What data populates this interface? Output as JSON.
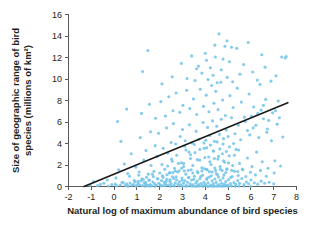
{
  "chart_data": {
    "type": "scatter",
    "title": "",
    "xlabel": "Natural log of maximum abundance of bird species",
    "ylabel": "Size of geographic range of bird species (millions of km²)",
    "ylabel_line1": "Size of geographic range of bird",
    "ylabel_line2": "species (millions of km²)",
    "xlim": [
      -2,
      8
    ],
    "ylim": [
      0,
      16
    ],
    "xticks": [
      -2,
      -1,
      0,
      1,
      2,
      3,
      4,
      5,
      6,
      7,
      8
    ],
    "xticklabels": [
      "-2",
      "-1",
      "0",
      "1",
      "2",
      "3",
      "4",
      "5",
      "6",
      "7",
      "8"
    ],
    "yticks": [
      0,
      2,
      4,
      6,
      8,
      10,
      12,
      14,
      16
    ],
    "yticklabels": [
      "0",
      "2",
      "4",
      "6",
      "8",
      "10",
      "12",
      "14",
      "16"
    ],
    "grid": false,
    "legend": null,
    "point_color": "#74c4e8",
    "trendline_color": "#1a1a1a",
    "axis_color": "#58595b",
    "background_color": "#ffffff",
    "trendline": {
      "type": "linear-fit",
      "x_start": -1.32,
      "y_start": 0.0,
      "x_end": 7.62,
      "y_end": 7.8,
      "slope": 0.872,
      "intercept": 1.151
    },
    "n_points": 508,
    "points": [
      [
        -1.05,
        0.12
      ],
      [
        -0.72,
        0.08
      ],
      [
        -0.45,
        0.3
      ],
      [
        -0.25,
        0.05
      ],
      [
        -0.1,
        0.18
      ],
      [
        0.05,
        0.22
      ],
      [
        0.12,
        0.07
      ],
      [
        0.28,
        0.14
      ],
      [
        0.35,
        0.4
      ],
      [
        0.48,
        0.1
      ],
      [
        0.55,
        0.25
      ],
      [
        0.62,
        0.06
      ],
      [
        0.7,
        0.33
      ],
      [
        0.78,
        0.11
      ],
      [
        0.85,
        0.2
      ],
      [
        0.92,
        0.45
      ],
      [
        1.0,
        0.09
      ],
      [
        1.05,
        0.28
      ],
      [
        1.12,
        0.15
      ],
      [
        1.18,
        0.52
      ],
      [
        1.25,
        0.08
      ],
      [
        1.32,
        0.35
      ],
      [
        1.38,
        0.22
      ],
      [
        1.45,
        0.13
      ],
      [
        1.52,
        0.6
      ],
      [
        1.58,
        0.18
      ],
      [
        1.65,
        0.07
      ],
      [
        1.7,
        0.42
      ],
      [
        1.78,
        0.26
      ],
      [
        1.85,
        0.11
      ],
      [
        1.9,
        0.75
      ],
      [
        1.96,
        0.3
      ],
      [
        2.02,
        0.16
      ],
      [
        2.08,
        0.55
      ],
      [
        2.14,
        0.09
      ],
      [
        2.2,
        0.38
      ],
      [
        2.26,
        0.22
      ],
      [
        2.32,
        0.68
      ],
      [
        2.38,
        0.14
      ],
      [
        2.44,
        0.48
      ],
      [
        2.5,
        0.27
      ],
      [
        2.56,
        0.9
      ],
      [
        2.62,
        0.12
      ],
      [
        2.68,
        0.35
      ],
      [
        2.74,
        0.62
      ],
      [
        2.8,
        0.2
      ],
      [
        2.86,
        0.44
      ],
      [
        2.92,
        0.16
      ],
      [
        2.98,
        0.78
      ],
      [
        3.04,
        0.3
      ],
      [
        3.1,
        0.55
      ],
      [
        3.16,
        0.1
      ],
      [
        3.22,
        0.4
      ],
      [
        3.28,
        0.85
      ],
      [
        3.34,
        0.24
      ],
      [
        3.4,
        0.6
      ],
      [
        3.46,
        0.15
      ],
      [
        3.52,
        0.95
      ],
      [
        3.58,
        0.32
      ],
      [
        3.64,
        0.5
      ],
      [
        3.7,
        0.18
      ],
      [
        3.76,
        0.72
      ],
      [
        3.82,
        0.28
      ],
      [
        3.88,
        1.05
      ],
      [
        3.94,
        0.4
      ],
      [
        4.0,
        0.2
      ],
      [
        4.06,
        0.66
      ],
      [
        4.12,
        0.34
      ],
      [
        4.18,
        0.88
      ],
      [
        4.24,
        0.13
      ],
      [
        4.3,
        0.52
      ],
      [
        4.36,
        0.26
      ],
      [
        4.42,
        0.7
      ],
      [
        4.48,
        0.38
      ],
      [
        4.54,
        1.1
      ],
      [
        4.6,
        0.18
      ],
      [
        4.66,
        0.58
      ],
      [
        4.72,
        0.3
      ],
      [
        4.78,
        0.8
      ],
      [
        4.84,
        0.22
      ],
      [
        4.9,
        0.46
      ],
      [
        4.96,
        0.14
      ],
      [
        5.02,
        0.64
      ],
      [
        5.1,
        0.28
      ],
      [
        5.18,
        0.92
      ],
      [
        5.26,
        0.36
      ],
      [
        5.34,
        0.2
      ],
      [
        5.42,
        0.56
      ],
      [
        5.5,
        0.3
      ],
      [
        5.6,
        0.74
      ],
      [
        5.7,
        0.18
      ],
      [
        5.8,
        0.42
      ],
      [
        5.9,
        0.26
      ],
      [
        6.0,
        0.6
      ],
      [
        6.15,
        0.34
      ],
      [
        6.3,
        0.22
      ],
      [
        6.45,
        0.5
      ],
      [
        6.6,
        0.3
      ],
      [
        6.8,
        0.4
      ],
      [
        7.0,
        0.26
      ],
      [
        0.2,
        1.55
      ],
      [
        0.45,
        2.1
      ],
      [
        0.6,
        1.2
      ],
      [
        0.95,
        1.8
      ],
      [
        1.1,
        1.35
      ],
      [
        1.3,
        2.45
      ],
      [
        1.5,
        1.15
      ],
      [
        1.62,
        1.95
      ],
      [
        1.75,
        1.42
      ],
      [
        1.88,
        2.8
      ],
      [
        2.0,
        1.25
      ],
      [
        2.1,
        2.05
      ],
      [
        2.22,
        1.6
      ],
      [
        2.35,
        3.1
      ],
      [
        2.45,
        1.3
      ],
      [
        2.55,
        2.35
      ],
      [
        2.65,
        1.7
      ],
      [
        2.75,
        2.9
      ],
      [
        2.85,
        1.45
      ],
      [
        2.95,
        2.2
      ],
      [
        3.05,
        1.85
      ],
      [
        3.15,
        3.4
      ],
      [
        3.25,
        1.5
      ],
      [
        3.35,
        2.6
      ],
      [
        3.45,
        1.95
      ],
      [
        3.55,
        3.15
      ],
      [
        3.65,
        1.4
      ],
      [
        3.75,
        2.45
      ],
      [
        3.85,
        1.75
      ],
      [
        3.95,
        3.55
      ],
      [
        4.05,
        1.6
      ],
      [
        4.15,
        2.75
      ],
      [
        4.25,
        2.05
      ],
      [
        4.35,
        3.3
      ],
      [
        4.45,
        1.5
      ],
      [
        4.55,
        2.55
      ],
      [
        4.65,
        1.85
      ],
      [
        4.75,
        3.05
      ],
      [
        4.85,
        2.25
      ],
      [
        4.95,
        1.65
      ],
      [
        5.05,
        2.85
      ],
      [
        5.2,
        1.95
      ],
      [
        5.35,
        3.45
      ],
      [
        5.5,
        2.15
      ],
      [
        5.65,
        1.55
      ],
      [
        5.85,
        2.65
      ],
      [
        6.05,
        1.85
      ],
      [
        6.25,
        3.2
      ],
      [
        6.5,
        2.3
      ],
      [
        6.75,
        1.7
      ],
      [
        7.05,
        2.4
      ],
      [
        7.3,
        1.9
      ],
      [
        0.3,
        4.2
      ],
      [
        0.75,
        3.05
      ],
      [
        1.15,
        4.55
      ],
      [
        1.4,
        3.35
      ],
      [
        1.6,
        5.1
      ],
      [
        1.8,
        3.8
      ],
      [
        1.95,
        4.95
      ],
      [
        2.15,
        3.55
      ],
      [
        2.3,
        5.45
      ],
      [
        2.5,
        4.1
      ],
      [
        2.6,
        5.85
      ],
      [
        2.7,
        3.95
      ],
      [
        2.9,
        4.65
      ],
      [
        3.0,
        5.3
      ],
      [
        3.12,
        4.25
      ],
      [
        3.3,
        5.75
      ],
      [
        3.42,
        4.05
      ],
      [
        3.6,
        5.15
      ],
      [
        3.72,
        4.4
      ],
      [
        3.9,
        5.95
      ],
      [
        4.02,
        4.3
      ],
      [
        4.1,
        5.5
      ],
      [
        4.2,
        4.75
      ],
      [
        4.32,
        6.1
      ],
      [
        4.4,
        4.2
      ],
      [
        4.5,
        5.6
      ],
      [
        4.62,
        4.85
      ],
      [
        4.7,
        6.25
      ],
      [
        4.8,
        4.45
      ],
      [
        4.92,
        5.25
      ],
      [
        5.0,
        4.65
      ],
      [
        5.15,
        6.4
      ],
      [
        5.3,
        4.9
      ],
      [
        5.45,
        5.7
      ],
      [
        5.55,
        4.35
      ],
      [
        5.75,
        6.05
      ],
      [
        5.95,
        4.8
      ],
      [
        6.1,
        5.45
      ],
      [
        6.35,
        4.55
      ],
      [
        6.55,
        6.3
      ],
      [
        6.7,
        5.05
      ],
      [
        6.9,
        4.25
      ],
      [
        7.15,
        5.8
      ],
      [
        7.4,
        4.6
      ],
      [
        0.15,
        6.05
      ],
      [
        0.55,
        7.2
      ],
      [
        1.2,
        6.8
      ],
      [
        1.55,
        7.65
      ],
      [
        1.82,
        6.35
      ],
      [
        2.05,
        7.9
      ],
      [
        2.25,
        6.55
      ],
      [
        2.4,
        8.35
      ],
      [
        2.58,
        7.05
      ],
      [
        2.72,
        8.7
      ],
      [
        2.88,
        6.9
      ],
      [
        3.02,
        7.55
      ],
      [
        3.18,
        8.95
      ],
      [
        3.32,
        7.25
      ],
      [
        3.48,
        8.15
      ],
      [
        3.62,
        6.7
      ],
      [
        3.78,
        9.05
      ],
      [
        3.92,
        7.45
      ],
      [
        4.04,
        8.5
      ],
      [
        4.16,
        6.95
      ],
      [
        4.28,
        9.4
      ],
      [
        4.38,
        7.75
      ],
      [
        4.46,
        8.85
      ],
      [
        4.56,
        7.15
      ],
      [
        4.68,
        9.7
      ],
      [
        4.76,
        8.05
      ],
      [
        4.88,
        6.6
      ],
      [
        5.08,
        8.45
      ],
      [
        5.22,
        7.35
      ],
      [
        5.4,
        9.15
      ],
      [
        5.58,
        7.85
      ],
      [
        5.72,
        6.45
      ],
      [
        5.92,
        8.6
      ],
      [
        6.12,
        7.4
      ],
      [
        6.4,
        9.5
      ],
      [
        6.65,
        8.1
      ],
      [
        6.95,
        6.85
      ],
      [
        7.2,
        7.95
      ],
      [
        1.25,
        10.7
      ],
      [
        1.48,
        12.65
      ],
      [
        2.1,
        9.55
      ],
      [
        2.55,
        10.2
      ],
      [
        2.95,
        11.45
      ],
      [
        3.2,
        10.05
      ],
      [
        3.4,
        12.15
      ],
      [
        3.55,
        9.85
      ],
      [
        3.7,
        11.2
      ],
      [
        3.85,
        10.55
      ],
      [
        4.0,
        12.4
      ],
      [
        4.12,
        9.95
      ],
      [
        4.22,
        11.05
      ],
      [
        4.34,
        10.35
      ],
      [
        4.44,
        12.05
      ],
      [
        4.52,
        9.65
      ],
      [
        4.6,
        14.2
      ],
      [
        4.7,
        10.85
      ],
      [
        4.78,
        11.85
      ],
      [
        4.86,
        13.05
      ],
      [
        4.96,
        10.15
      ],
      [
        5.06,
        11.6
      ],
      [
        5.2,
        9.75
      ],
      [
        5.38,
        12.85
      ],
      [
        5.52,
        10.45
      ],
      [
        5.68,
        11.35
      ],
      [
        5.88,
        13.4
      ],
      [
        6.08,
        10.65
      ],
      [
        6.28,
        9.9
      ],
      [
        6.48,
        12.25
      ],
      [
        6.62,
        11.1
      ],
      [
        6.88,
        9.8
      ],
      [
        7.1,
        10.3
      ],
      [
        7.35,
        12.05
      ],
      [
        7.5,
        11.95
      ],
      [
        7.55,
        12.1
      ],
      [
        -0.9,
        0.45
      ],
      [
        -0.6,
        0.2
      ],
      [
        -0.3,
        0.6
      ],
      [
        0.08,
        0.8
      ],
      [
        0.4,
        0.35
      ],
      [
        0.68,
        0.95
      ],
      [
        0.88,
        0.55
      ],
      [
        1.08,
        1.05
      ],
      [
        1.28,
        0.65
      ],
      [
        1.42,
        0.85
      ],
      [
        1.68,
        1.15
      ],
      [
        1.92,
        0.7
      ],
      [
        2.12,
        1.0
      ],
      [
        2.28,
        0.48
      ],
      [
        2.42,
        1.25
      ],
      [
        2.62,
        0.75
      ],
      [
        2.78,
        1.35
      ],
      [
        2.98,
        0.58
      ],
      [
        3.08,
        1.45
      ],
      [
        3.26,
        0.82
      ],
      [
        3.38,
        1.55
      ],
      [
        3.5,
        0.68
      ],
      [
        3.68,
        1.28
      ],
      [
        3.8,
        0.92
      ],
      [
        3.96,
        1.65
      ],
      [
        4.08,
        0.78
      ],
      [
        4.18,
        1.38
      ],
      [
        4.26,
        1.0
      ],
      [
        4.42,
        1.72
      ],
      [
        4.58,
        0.88
      ],
      [
        4.74,
        1.48
      ],
      [
        4.82,
        1.08
      ],
      [
        4.94,
        1.58
      ],
      [
        5.12,
        0.85
      ],
      [
        5.28,
        1.42
      ],
      [
        5.44,
        1.02
      ],
      [
        5.62,
        1.62
      ],
      [
        5.78,
        0.92
      ],
      [
        5.98,
        1.32
      ],
      [
        6.2,
        1.08
      ],
      [
        6.42,
        1.5
      ],
      [
        6.68,
        0.95
      ],
      [
        7.02,
        1.25
      ],
      [
        2.05,
        0.04
      ],
      [
        2.48,
        0.03
      ],
      [
        2.85,
        0.05
      ],
      [
        3.14,
        0.02
      ],
      [
        3.36,
        0.06
      ],
      [
        3.58,
        0.03
      ],
      [
        3.74,
        0.05
      ],
      [
        3.9,
        0.02
      ],
      [
        4.02,
        0.07
      ],
      [
        4.14,
        0.03
      ],
      [
        4.26,
        0.05
      ],
      [
        4.38,
        0.02
      ],
      [
        4.5,
        0.06
      ],
      [
        4.62,
        0.04
      ],
      [
        4.74,
        0.03
      ],
      [
        4.86,
        0.05
      ],
      [
        4.98,
        0.02
      ],
      [
        5.14,
        0.06
      ],
      [
        5.32,
        0.03
      ],
      [
        5.48,
        0.05
      ],
      [
        1.35,
        0.03
      ],
      [
        1.58,
        0.05
      ],
      [
        1.8,
        0.02
      ],
      [
        2.25,
        0.06
      ],
      [
        2.65,
        0.04
      ],
      [
        3.0,
        0.03
      ],
      [
        3.22,
        0.05
      ],
      [
        3.44,
        0.02
      ],
      [
        3.66,
        0.04
      ],
      [
        3.88,
        0.06
      ],
      [
        4.1,
        0.03
      ],
      [
        4.32,
        0.05
      ],
      [
        4.54,
        0.02
      ],
      [
        4.76,
        0.04
      ],
      [
        5.0,
        0.06
      ],
      [
        0.6,
        0.02
      ],
      [
        0.95,
        0.04
      ],
      [
        1.5,
        0.06
      ],
      [
        5.7,
        0.04
      ],
      [
        6.0,
        0.02
      ],
      [
        3.05,
        2.15
      ],
      [
        3.15,
        1.15
      ],
      [
        3.35,
        2.95
      ],
      [
        3.45,
        1.25
      ],
      [
        3.65,
        2.5
      ],
      [
        3.85,
        1.45
      ],
      [
        3.98,
        2.7
      ],
      [
        4.08,
        1.55
      ],
      [
        4.2,
        2.3
      ],
      [
        4.3,
        1.35
      ],
      [
        4.4,
        2.6
      ],
      [
        4.48,
        1.2
      ],
      [
        4.58,
        2.8
      ],
      [
        4.66,
        1.6
      ],
      [
        4.8,
        2.4
      ],
      [
        4.9,
        1.3
      ],
      [
        5.02,
        2.2
      ],
      [
        5.16,
        1.5
      ],
      [
        5.28,
        2.9
      ],
      [
        5.42,
        1.4
      ],
      [
        3.1,
        3.75
      ],
      [
        3.28,
        3.2
      ],
      [
        3.52,
        3.9
      ],
      [
        3.76,
        3.45
      ],
      [
        3.94,
        4.05
      ],
      [
        4.06,
        3.6
      ],
      [
        4.22,
        3.85
      ],
      [
        4.36,
        3.3
      ],
      [
        4.52,
        4.15
      ],
      [
        4.64,
        3.5
      ],
      [
        4.78,
        3.95
      ],
      [
        4.92,
        3.25
      ],
      [
        5.06,
        3.7
      ],
      [
        5.24,
        4.0
      ],
      [
        5.46,
        3.4
      ],
      [
        2.35,
        1.9
      ],
      [
        2.52,
        2.55
      ],
      [
        2.68,
        1.45
      ],
      [
        2.82,
        2.15
      ],
      [
        2.96,
        1.7
      ],
      [
        2.15,
        0.85
      ],
      [
        2.32,
        1.1
      ],
      [
        2.46,
        0.62
      ],
      [
        2.58,
        1.3
      ],
      [
        2.72,
        0.9
      ],
      [
        1.05,
        0.48
      ],
      [
        1.22,
        0.72
      ],
      [
        1.38,
        0.38
      ],
      [
        1.55,
        0.58
      ],
      [
        1.72,
        0.92
      ],
      [
        6.3,
        6.8
      ],
      [
        6.55,
        7.55
      ],
      [
        6.78,
        6.15
      ],
      [
        7.08,
        7.05
      ],
      [
        7.25,
        6.4
      ],
      [
        5.85,
        5.2
      ],
      [
        6.02,
        6.55
      ],
      [
        6.22,
        5.7
      ],
      [
        6.45,
        7.1
      ],
      [
        6.72,
        5.35
      ],
      [
        4.95,
        13.55
      ],
      [
        5.15,
        12.95
      ],
      [
        4.42,
        13.15
      ],
      [
        4.05,
        11.75
      ],
      [
        3.62,
        10.95
      ]
    ]
  }
}
